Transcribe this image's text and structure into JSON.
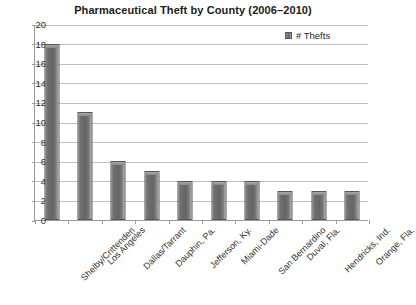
{
  "chart_data": {
    "type": "bar",
    "title": "Pharmaceutical Theft by County (2006–2010)",
    "xlabel": "",
    "ylabel": "",
    "ylim": [
      0,
      20
    ],
    "ytick_step": 2,
    "yticks": [
      "20",
      "18",
      "16",
      "14",
      "12",
      "10",
      "8",
      "6",
      "4",
      "2",
      "0"
    ],
    "grid": true,
    "legend_position": "top-right",
    "legend": [
      "# Thefts"
    ],
    "categories": [
      "Shelby/Crittenden",
      "Los Angeles",
      "Dallas/Tarrant",
      "Dauphin, Pa.",
      "Jefferson, Ky.",
      "Miami-Dade",
      "San Bernardino",
      "Duval, Fla.",
      "Hendricks, Ind.",
      "Orange, Fla."
    ],
    "series": [
      {
        "name": "# Thefts",
        "values": [
          18,
          11,
          6,
          5,
          4,
          4,
          4,
          3,
          3,
          3
        ]
      }
    ],
    "colors": {
      "bar": "#6f6f6f",
      "bar_edge": "#575757",
      "gridline": "#bfbfbf",
      "axis": "#9a9a9a",
      "text": "#1b1b1b",
      "background": "#ffffff"
    }
  }
}
